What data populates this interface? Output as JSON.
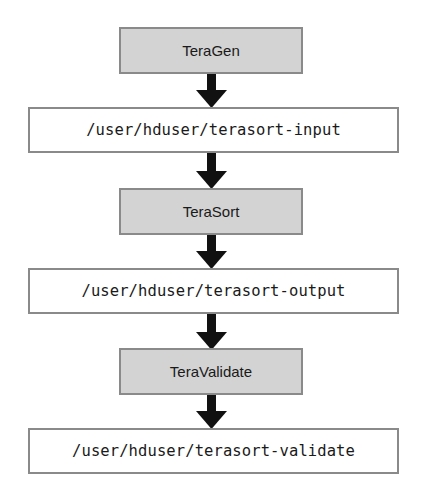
{
  "diagram": {
    "type": "flowchart",
    "direction": "top-to-bottom",
    "nodes": [
      {
        "id": "teragen",
        "label": "TeraGen",
        "kind": "process"
      },
      {
        "id": "input",
        "label": "/user/hduser/terasort-input",
        "kind": "hdfs-path"
      },
      {
        "id": "terasort",
        "label": "TeraSort",
        "kind": "process"
      },
      {
        "id": "output",
        "label": "/user/hduser/terasort-output",
        "kind": "hdfs-path"
      },
      {
        "id": "teravalidate",
        "label": "TeraValidate",
        "kind": "process"
      },
      {
        "id": "validate",
        "label": "/user/hduser/terasort-validate",
        "kind": "hdfs-path"
      }
    ],
    "edges": [
      {
        "from": "teragen",
        "to": "input"
      },
      {
        "from": "input",
        "to": "terasort"
      },
      {
        "from": "terasort",
        "to": "output"
      },
      {
        "from": "output",
        "to": "teravalidate"
      },
      {
        "from": "teravalidate",
        "to": "validate"
      }
    ],
    "colors": {
      "process_fill": "#d3d3d3",
      "path_fill": "#ffffff",
      "border": "#8a8a8a",
      "arrow": "#111111"
    }
  }
}
